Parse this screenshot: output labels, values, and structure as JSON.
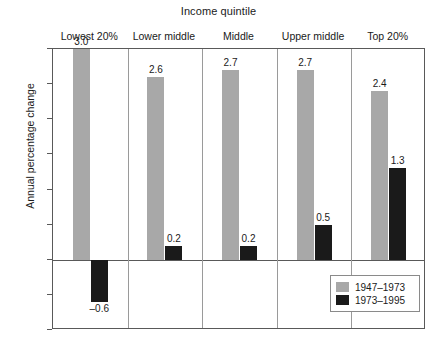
{
  "chart_data": {
    "type": "bar",
    "title": "Income quintile",
    "xlabel": "Income quintile",
    "ylabel": "Annual percentage change",
    "ylim": [
      -1.0,
      3.0
    ],
    "ytick_labels": [
      "3.0",
      "2.5",
      "2.0",
      "1.5",
      "1.0",
      "0.5",
      "0",
      "–0.5",
      "–1.0"
    ],
    "ytick_values": [
      3.0,
      2.5,
      2.0,
      1.5,
      1.0,
      0.5,
      0,
      -0.5,
      -1.0
    ],
    "grid": false,
    "legend_position": "bottom-right",
    "categories": [
      "Lowest 20%",
      "Lower middle",
      "Middle",
      "Upper middle",
      "Top 20%"
    ],
    "series": [
      {
        "name": "1947–1973",
        "color": "#a8a8a8",
        "values": [
          3.0,
          2.6,
          2.7,
          2.7,
          2.4
        ],
        "labels": [
          "3.0",
          "2.6",
          "2.7",
          "2.7",
          "2.4"
        ]
      },
      {
        "name": "1973–1995",
        "color": "#1a1a1a",
        "values": [
          -0.6,
          0.2,
          0.2,
          0.5,
          1.3
        ],
        "labels": [
          "–0.6",
          "0.2",
          "0.2",
          "0.5",
          "1.3"
        ]
      }
    ]
  }
}
